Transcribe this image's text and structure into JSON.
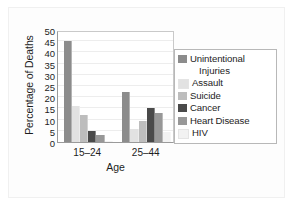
{
  "chart_data": {
    "type": "bar",
    "title": "",
    "xlabel": "Age",
    "ylabel": "Percentage of Deaths",
    "categories": [
      "15–24",
      "25–44"
    ],
    "ylim": [
      0,
      50
    ],
    "yticks": [
      0,
      5,
      10,
      15,
      20,
      25,
      30,
      35,
      40,
      45,
      50
    ],
    "grid": true,
    "legend_position": "right",
    "series": [
      {
        "name": "Unintentional Injuries",
        "values": [
          45,
          22.5
        ],
        "color": "#8c8c8c"
      },
      {
        "name": "Assault",
        "values": [
          16,
          6
        ],
        "color": "#e2e2e2"
      },
      {
        "name": "Suicide",
        "values": [
          12,
          9.5
        ],
        "color": "#bdbdbd"
      },
      {
        "name": "Cancer",
        "values": [
          5,
          15
        ],
        "color": "#4a4a4a"
      },
      {
        "name": "Heart Disease",
        "values": [
          3,
          13
        ],
        "color": "#989898"
      },
      {
        "name": "HIV",
        "values": [
          0.5,
          4.5
        ],
        "color": "#f2f2f2"
      }
    ]
  },
  "legend": {
    "entries": [
      {
        "label": "Unintentional",
        "continuation": "Injuries"
      },
      {
        "label": "Assault",
        "continuation": ""
      },
      {
        "label": "Suicide",
        "continuation": ""
      },
      {
        "label": "Cancer",
        "continuation": ""
      },
      {
        "label": "Heart Disease",
        "continuation": ""
      },
      {
        "label": "HIV",
        "continuation": ""
      }
    ]
  }
}
